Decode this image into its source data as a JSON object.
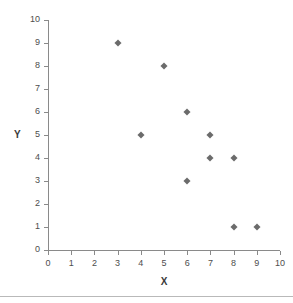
{
  "chart_data": {
    "type": "scatter",
    "title": "",
    "xlabel": "X",
    "ylabel": "Y",
    "xlim": [
      0,
      10
    ],
    "ylim": [
      0,
      10
    ],
    "xticks": [
      0,
      1,
      2,
      3,
      4,
      5,
      6,
      7,
      8,
      9,
      10
    ],
    "yticks": [
      0,
      1,
      2,
      3,
      4,
      5,
      6,
      7,
      8,
      9,
      10
    ],
    "grid": false,
    "legend": false,
    "marker": "diamond",
    "marker_color": "#6b6b6b",
    "axis_color": "#8a8a8a",
    "points": [
      {
        "x": 3,
        "y": 9
      },
      {
        "x": 5,
        "y": 8
      },
      {
        "x": 6,
        "y": 6
      },
      {
        "x": 4,
        "y": 5
      },
      {
        "x": 7,
        "y": 5
      },
      {
        "x": 7,
        "y": 4
      },
      {
        "x": 8,
        "y": 4
      },
      {
        "x": 6,
        "y": 3
      },
      {
        "x": 8,
        "y": 1
      },
      {
        "x": 9,
        "y": 1
      }
    ]
  },
  "geometry": {
    "origin_x": 48,
    "origin_y": 250,
    "x_step": 23.2,
    "y_step": 23.0
  }
}
